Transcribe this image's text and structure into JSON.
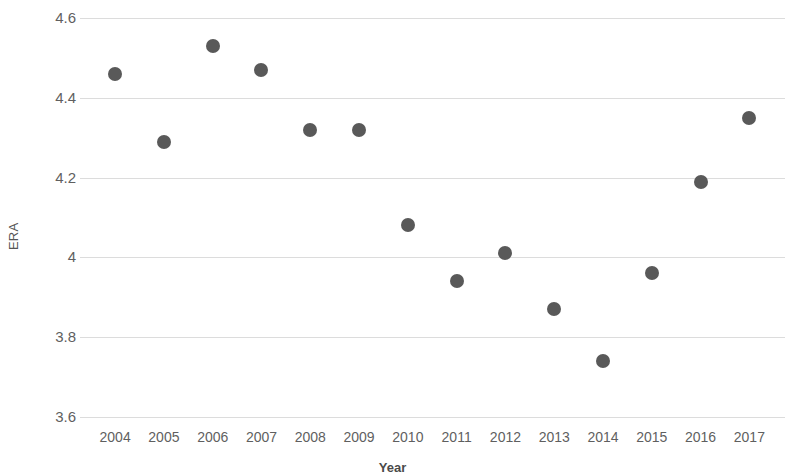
{
  "chart_data": {
    "type": "scatter",
    "title": "",
    "xlabel": "Year",
    "ylabel": "ERA",
    "categories": [
      2004,
      2005,
      2006,
      2007,
      2008,
      2009,
      2010,
      2011,
      2012,
      2013,
      2014,
      2015,
      2016,
      2017
    ],
    "x": [
      2004,
      2005,
      2006,
      2007,
      2008,
      2009,
      2010,
      2011,
      2012,
      2013,
      2014,
      2015,
      2016,
      2017
    ],
    "values": [
      4.46,
      4.29,
      4.53,
      4.47,
      4.32,
      4.32,
      4.08,
      3.94,
      4.01,
      3.87,
      3.74,
      3.96,
      4.19,
      4.35
    ],
    "series": [
      {
        "name": "ERA",
        "values": [
          4.46,
          4.29,
          4.53,
          4.47,
          4.32,
          4.32,
          4.08,
          3.94,
          4.01,
          3.87,
          3.74,
          3.96,
          4.19,
          4.35
        ]
      }
    ],
    "x_tick_labels": [
      "2004",
      "2005",
      "2006",
      "2007",
      "2008",
      "2009",
      "2010",
      "2011",
      "2012",
      "2013",
      "2014",
      "2015",
      "2016",
      "2017"
    ],
    "y_tick_labels": [
      "4.6",
      "4.4",
      "4.2",
      "4",
      "3.8",
      "3.6"
    ],
    "y_ticks": [
      4.6,
      4.4,
      4.2,
      4.0,
      3.8,
      3.6
    ],
    "ylim": [
      3.6,
      4.6
    ],
    "xlim": [
      2003.5,
      2017.5
    ],
    "grid": "horizontal",
    "legend": "none",
    "marker_color": "#595959",
    "gridline_color": "#dcdcdc",
    "axis_text_color": "#5f5f5f"
  }
}
